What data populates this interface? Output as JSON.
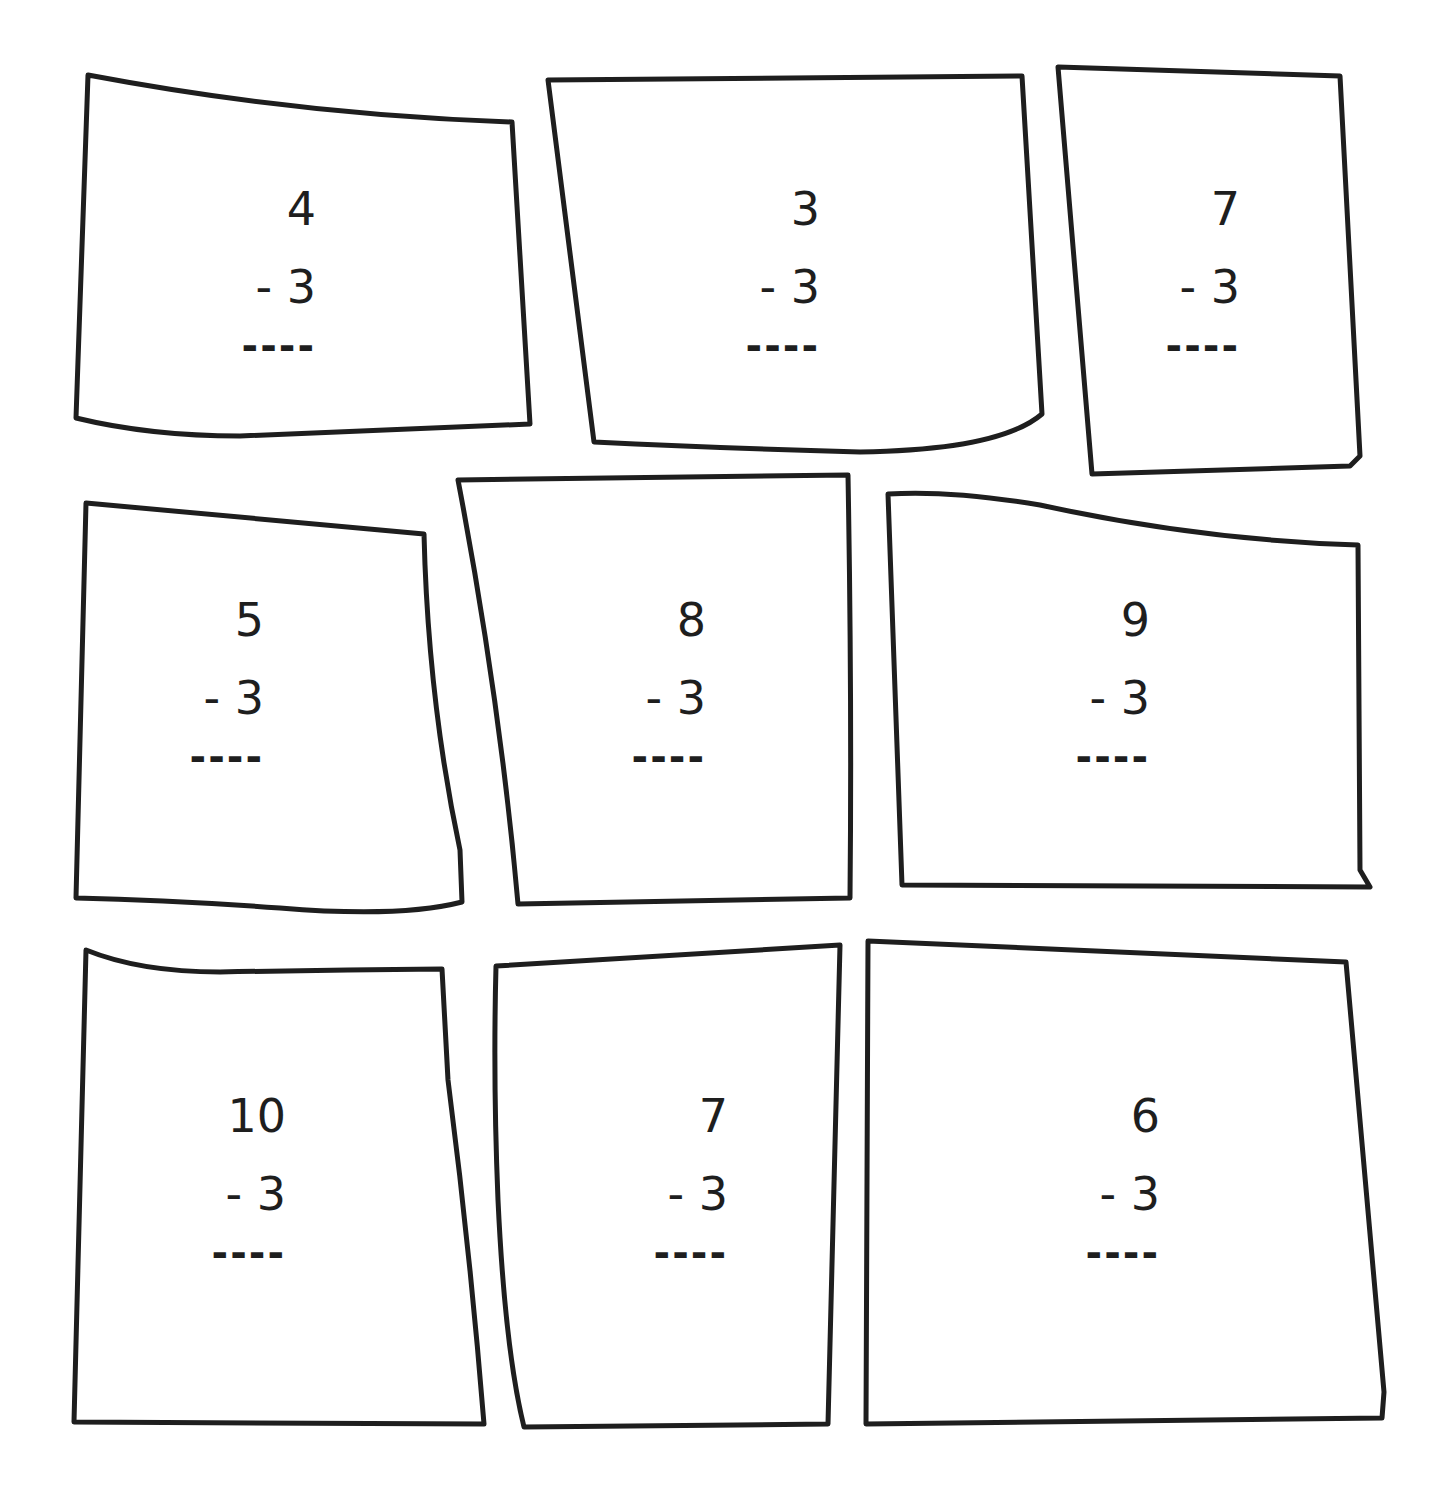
{
  "worksheet": {
    "problems": [
      {
        "minuend": "4",
        "subtrahend": "- 3",
        "answer_line": "----"
      },
      {
        "minuend": "3",
        "subtrahend": "- 3",
        "answer_line": "----"
      },
      {
        "minuend": "7",
        "subtrahend": "- 3",
        "answer_line": "----"
      },
      {
        "minuend": "5",
        "subtrahend": "- 3",
        "answer_line": "----"
      },
      {
        "minuend": "8",
        "subtrahend": "- 3",
        "answer_line": "----"
      },
      {
        "minuend": "9",
        "subtrahend": "- 3",
        "answer_line": "----"
      },
      {
        "minuend": "10",
        "subtrahend": "- 3",
        "answer_line": "----"
      },
      {
        "minuend": "7",
        "subtrahend": "- 3",
        "answer_line": "----"
      },
      {
        "minuend": "6",
        "subtrahend": "- 3",
        "answer_line": "----"
      }
    ]
  }
}
